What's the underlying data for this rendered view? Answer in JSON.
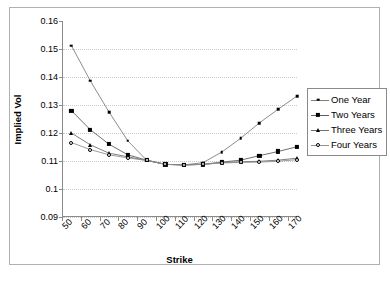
{
  "chart_data": {
    "type": "line",
    "title": "",
    "xlabel": "Strike",
    "ylabel": "Implied Vol",
    "xlim": [
      50,
      175
    ],
    "ylim": [
      0.09,
      0.16
    ],
    "ytick_values": [
      0.16,
      0.15,
      0.14,
      0.13,
      0.12,
      0.11,
      0.1,
      0.09
    ],
    "ytick_labels": [
      "0.16",
      "0.15",
      "0.14",
      "0.13",
      "0.12",
      "0.11",
      "0.1",
      "0.09"
    ],
    "xtick_values": [
      50,
      60,
      70,
      80,
      90,
      100,
      110,
      120,
      130,
      140,
      150,
      160,
      170
    ],
    "xtick_labels": [
      "50",
      "60",
      "70",
      "80",
      "90",
      "100",
      "110",
      "120",
      "130",
      "140",
      "150",
      "160",
      "170"
    ],
    "grid": "horizontal-dotted",
    "legend_position": "right",
    "x": [
      55,
      65,
      75,
      85,
      95,
      105,
      115,
      125,
      135,
      145,
      155,
      165,
      175
    ],
    "series": [
      {
        "name": "One Year",
        "marker": "small-square",
        "color": "#000000",
        "line_color": "#808080",
        "values": [
          0.1512,
          0.1387,
          0.1275,
          0.1172,
          0.1103,
          0.1088,
          0.1086,
          0.1094,
          0.1132,
          0.1181,
          0.1236,
          0.1285,
          0.1332
        ]
      },
      {
        "name": "Two Years",
        "marker": "filled-square",
        "color": "#000000",
        "line_color": "#606060",
        "values": [
          0.128,
          0.1212,
          0.116,
          0.1122,
          0.1103,
          0.1088,
          0.1086,
          0.1088,
          0.1096,
          0.1103,
          0.1119,
          0.1134,
          0.1151
        ]
      },
      {
        "name": "Three Years",
        "marker": "triangle",
        "color": "#000000",
        "line_color": "#707070",
        "values": [
          0.12,
          0.1158,
          0.1128,
          0.1115,
          0.1102,
          0.1088,
          0.1086,
          0.1088,
          0.1094,
          0.1097,
          0.1099,
          0.1103,
          0.111
        ]
      },
      {
        "name": "Four Years",
        "marker": "open-circle",
        "color": "#000000",
        "line_color": "#909090",
        "values": [
          0.1166,
          0.1141,
          0.1122,
          0.1111,
          0.1102,
          0.1088,
          0.1086,
          0.1088,
          0.1093,
          0.1095,
          0.1096,
          0.1099,
          0.1105
        ]
      }
    ]
  }
}
